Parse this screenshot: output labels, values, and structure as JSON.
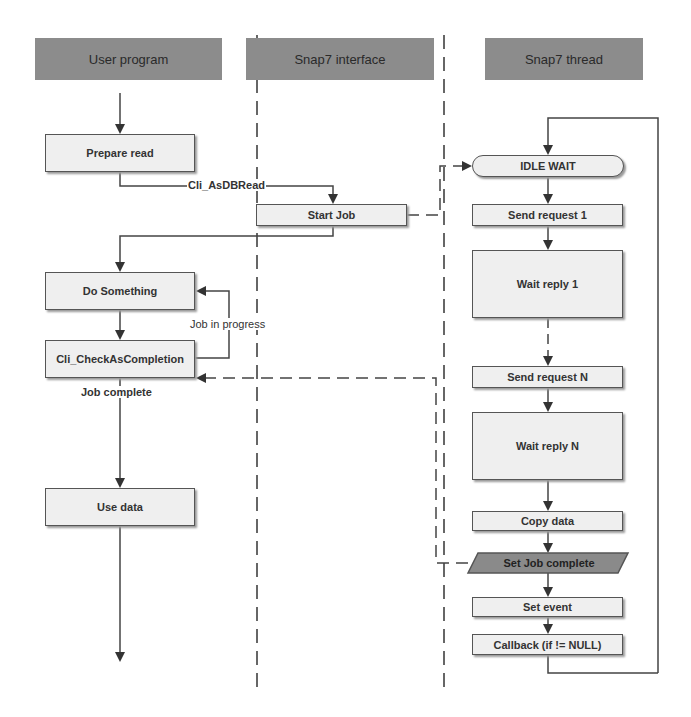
{
  "lanes": [
    {
      "id": "user",
      "title": "User program"
    },
    {
      "id": "interface",
      "title": "Snap7 interface"
    },
    {
      "id": "thread",
      "title": "Snap7 thread"
    }
  ],
  "user_program": {
    "prepare_read": "Prepare read",
    "do_something": "Do Something",
    "check_completion": "Cli_CheckAsCompletion",
    "use_data": "Use data"
  },
  "interface": {
    "start_job": "Start Job"
  },
  "thread": {
    "idle_wait": "IDLE WAIT",
    "send_request_1": "Send request 1",
    "wait_reply_1": "Wait reply 1",
    "send_request_n": "Send request N",
    "wait_reply_n": "Wait reply N",
    "copy_data": "Copy data",
    "set_job_complete": "Set Job complete",
    "set_event": "Set event",
    "callback": "Callback (if != NULL)"
  },
  "edge_labels": {
    "as_db_read": "Cli_AsDBRead",
    "job_in_progress": "Job in progress",
    "job_complete": "Job complete"
  },
  "colors": {
    "header_bg": "#8c8c8c",
    "box_bg": "#efefef",
    "line": "#444444",
    "parallelogram_bg": "#8a8a8a"
  }
}
